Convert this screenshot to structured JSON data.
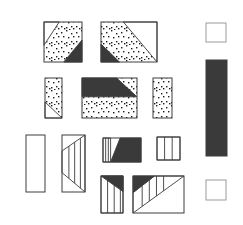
{
  "diagram": {
    "kind": "quilt-block-piecing-diagram",
    "colors": {
      "dark": "#3a3a3a",
      "line": "#3c3c3c",
      "dot": "#1c1c1c",
      "white": "#ffffff",
      "border_light": "#9a9a9a",
      "background": "#ffffff"
    },
    "dot_pattern": [
      [
        1,
        2
      ],
      [
        6,
        0
      ],
      [
        11,
        3
      ],
      [
        3,
        6
      ],
      [
        8,
        7
      ],
      [
        13,
        6
      ],
      [
        1,
        11
      ],
      [
        6,
        12
      ],
      [
        11,
        11
      ],
      [
        13,
        13
      ],
      [
        4,
        13
      ],
      [
        9,
        14
      ]
    ],
    "pieces": [
      {
        "name": "patch-square-dotted-top-left",
        "x": 44,
        "y": 22,
        "w": 38,
        "h": 40,
        "border": "dark",
        "layers": [
          {
            "type": "rect",
            "fill": "dots"
          },
          {
            "type": "polygon",
            "fill": "white",
            "points": [
              [
                0,
                0
              ],
              [
                0.4,
                0
              ],
              [
                0,
                0.58
              ]
            ]
          },
          {
            "type": "polygon",
            "fill": "dark",
            "points": [
              [
                1,
                0.45
              ],
              [
                1,
                1
              ],
              [
                0.52,
                1
              ]
            ]
          }
        ]
      },
      {
        "name": "patch-rect-dotted-top-right",
        "x": 101,
        "y": 22,
        "w": 56,
        "h": 40,
        "border": "dark",
        "layers": [
          {
            "type": "rect",
            "fill": "dots"
          },
          {
            "type": "polygon",
            "fill": "white",
            "points": [
              [
                0.4,
                0
              ],
              [
                1,
                0
              ],
              [
                1,
                1
              ]
            ]
          },
          {
            "type": "polygon",
            "fill": "dark",
            "points": [
              [
                0,
                0.55
              ],
              [
                0.33,
                1
              ],
              [
                0,
                1
              ]
            ]
          }
        ]
      },
      {
        "name": "patch-square-white-top-right",
        "x": 206,
        "y": 23,
        "w": 20,
        "h": 19,
        "border": "light",
        "layers": [
          {
            "type": "rect",
            "fill": "white"
          }
        ]
      },
      {
        "name": "patch-rect-dotted-row2-left",
        "x": 45,
        "y": 78,
        "w": 17,
        "h": 40,
        "border": "dark",
        "layers": [
          {
            "type": "rect",
            "fill": "dots"
          },
          {
            "type": "polygon",
            "fill": "white",
            "points": [
              [
                0,
                0.6
              ],
              [
                1,
                1
              ],
              [
                0,
                1
              ]
            ]
          }
        ]
      },
      {
        "name": "patch-rect-dotted-dark-band-center",
        "x": 82,
        "y": 78,
        "w": 55,
        "h": 40,
        "border": "dark",
        "layers": [
          {
            "type": "rect",
            "fill": "dots"
          },
          {
            "type": "polygon",
            "fill": "dark",
            "points": [
              [
                0,
                0
              ],
              [
                0.63,
                0
              ],
              [
                1,
                0.47
              ],
              [
                0,
                0.47
              ]
            ]
          }
        ]
      },
      {
        "name": "patch-rect-dotted-row2-right",
        "x": 153,
        "y": 78,
        "w": 19,
        "h": 40,
        "border": "dark",
        "layers": [
          {
            "type": "rect",
            "fill": "dots"
          }
        ]
      },
      {
        "name": "patch-bar-dark-right",
        "x": 206,
        "y": 60,
        "w": 21,
        "h": 96,
        "border": "dark",
        "layers": [
          {
            "type": "rect",
            "fill": "dark"
          }
        ]
      },
      {
        "name": "patch-rect-white-row3-left",
        "x": 26,
        "y": 135,
        "w": 19,
        "h": 57,
        "border": "dark",
        "layers": [
          {
            "type": "rect",
            "fill": "white"
          }
        ]
      },
      {
        "name": "patch-rect-striped-trapezoid",
        "x": 62,
        "y": 135,
        "w": 23,
        "h": 57,
        "border": "dark",
        "layers": [
          {
            "type": "rect",
            "fill": "white"
          },
          {
            "type": "polygon",
            "fill": "stripes",
            "points": [
              [
                0,
                0.28
              ],
              [
                1,
                0
              ],
              [
                1,
                1
              ],
              [
                0,
                0.66
              ]
            ],
            "stripe_fracs": [
              0.3,
              0.55,
              0.8
            ]
          }
        ]
      },
      {
        "name": "patch-rect-striped-white-dark-center",
        "x": 103,
        "y": 138,
        "w": 38,
        "h": 24,
        "border": "dark",
        "layers": [
          {
            "type": "rect",
            "fill": "white"
          },
          {
            "type": "polygon",
            "fill": "stripes",
            "points": [
              [
                0,
                0
              ],
              [
                0.2,
                0
              ],
              [
                0.2,
                1
              ],
              [
                0,
                1
              ]
            ],
            "stripe_fracs": [
              0.07,
              0.14
            ]
          },
          {
            "type": "polygon",
            "fill": "dark",
            "points": [
              [
                0.45,
                0
              ],
              [
                1,
                0
              ],
              [
                1,
                1
              ],
              [
                0.2,
                1
              ]
            ]
          }
        ]
      },
      {
        "name": "patch-square-striped-row3-right",
        "x": 157,
        "y": 137,
        "w": 23,
        "h": 23,
        "border": "dark",
        "layers": [
          {
            "type": "rect",
            "fill": "white"
          },
          {
            "type": "polygon",
            "fill": "stripes",
            "points": [
              [
                0,
                0
              ],
              [
                1,
                0
              ],
              [
                1,
                1
              ],
              [
                0,
                1
              ]
            ],
            "stripe_fracs": [
              0.33,
              0.66
            ]
          }
        ]
      },
      {
        "name": "patch-rect-striped-dark-corner-bottom",
        "x": 101,
        "y": 176,
        "w": 22,
        "h": 37,
        "border": "dark",
        "layers": [
          {
            "type": "rect",
            "fill": "white"
          },
          {
            "type": "polygon",
            "fill": "stripes",
            "points": [
              [
                0,
                0
              ],
              [
                1,
                0
              ],
              [
                1,
                1
              ],
              [
                0,
                1
              ]
            ],
            "stripe_fracs": [
              0.3,
              0.6,
              0.88
            ]
          },
          {
            "type": "polygon",
            "fill": "dark",
            "points": [
              [
                0,
                0
              ],
              [
                1,
                0
              ],
              [
                1,
                0.42
              ]
            ]
          }
        ]
      },
      {
        "name": "patch-square-pieced-bottom-right",
        "x": 133,
        "y": 176,
        "w": 51,
        "h": 37,
        "border": "dark",
        "layers": [
          {
            "type": "rect",
            "fill": "white"
          },
          {
            "type": "polygon",
            "fill": "stripes",
            "points": [
              [
                0,
                0.45
              ],
              [
                0.42,
                0
              ],
              [
                1,
                0
              ],
              [
                0,
                1
              ]
            ],
            "stripe_fracs": [
              0.18,
              0.32,
              0.46,
              0.6
            ]
          },
          {
            "type": "polygon",
            "fill": "dark",
            "points": [
              [
                0,
                0
              ],
              [
                0.42,
                0
              ],
              [
                0,
                0.45
              ]
            ]
          }
        ]
      },
      {
        "name": "patch-square-white-bottom-right",
        "x": 206,
        "y": 180,
        "w": 20,
        "h": 20,
        "border": "light",
        "layers": [
          {
            "type": "rect",
            "fill": "white"
          }
        ]
      }
    ]
  }
}
